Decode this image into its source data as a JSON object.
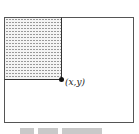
{
  "diagram": {
    "point_label": "(x,y)",
    "outer_rect": {
      "stroke": "#555555",
      "fill": "#ffffff"
    },
    "shaded_rect": {
      "pattern": "dotted-dashes",
      "fill": "#f4f4f4",
      "pattern_color": "#9a9a9a"
    },
    "point_color": "#111111"
  }
}
